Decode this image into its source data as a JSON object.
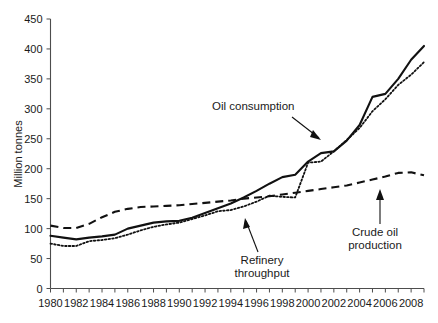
{
  "chart_data": {
    "type": "line",
    "title": "",
    "xlabel": "",
    "ylabel": "Million tonnes",
    "xlim": [
      1980,
      2009
    ],
    "ylim": [
      0,
      450
    ],
    "grid": false,
    "legend_position": "inline-annotations",
    "x": [
      1980,
      1981,
      1982,
      1983,
      1984,
      1985,
      1986,
      1987,
      1988,
      1989,
      1990,
      1991,
      1992,
      1993,
      1994,
      1995,
      1996,
      1997,
      1998,
      1999,
      2000,
      2001,
      2002,
      2003,
      2004,
      2005,
      2006,
      2007,
      2008,
      2009
    ],
    "x_tick_labels": [
      "1980",
      "1982",
      "1984",
      "1986",
      "1988",
      "1990",
      "1992",
      "1994",
      "1996",
      "1998",
      "2000",
      "2002",
      "2004",
      "2006",
      "2008"
    ],
    "y_ticks": [
      0,
      50,
      100,
      150,
      200,
      250,
      300,
      350,
      400,
      450
    ],
    "series": [
      {
        "name": "Oil consumption",
        "style": "solid",
        "values": [
          88,
          85,
          82,
          85,
          87,
          90,
          100,
          105,
          110,
          112,
          113,
          118,
          126,
          134,
          142,
          152,
          163,
          175,
          186,
          190,
          212,
          226,
          229,
          247,
          273,
          320,
          325,
          350,
          382,
          405
        ]
      },
      {
        "name": "Refinery throughput",
        "style": "dotted",
        "values": [
          75,
          71,
          71,
          79,
          81,
          84,
          90,
          97,
          103,
          107,
          110,
          116,
          122,
          129,
          131,
          137,
          145,
          155,
          153,
          152,
          210,
          212,
          229,
          248,
          268,
          296,
          316,
          340,
          357,
          378
        ]
      },
      {
        "name": "Crude oil production",
        "style": "dashed",
        "values": [
          105,
          101,
          101,
          108,
          119,
          128,
          133,
          136,
          137,
          138,
          139,
          141,
          143,
          145,
          147,
          150,
          152,
          154,
          157,
          160,
          163,
          166,
          169,
          172,
          177,
          182,
          187,
          193,
          194,
          189
        ]
      }
    ],
    "annotations": [
      {
        "label": "Oil consumption",
        "target_year": 2000,
        "target_value": 250
      },
      {
        "label": "Refinery throughput",
        "label_line_1": "Refinery",
        "label_line_2": "throughput",
        "target_year": 1995,
        "target_value": 135
      },
      {
        "label": "Crude oil production",
        "label_line_1": "Crude oil",
        "label_line_2": "production",
        "target_year": 2005,
        "target_value": 182
      }
    ]
  }
}
